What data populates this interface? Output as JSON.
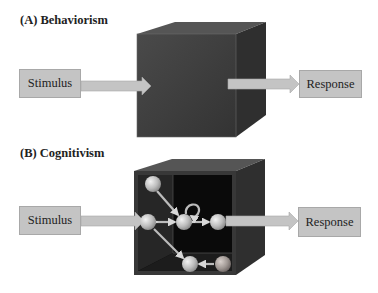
{
  "panels": [
    {
      "title": "(A)  Behaviorism",
      "input_label": "Stimulus",
      "output_label": "Response",
      "box_style": "opaque black box"
    },
    {
      "title": "(B)  Cognitivism",
      "input_label": "Stimulus",
      "output_label": "Response",
      "box_style": "transparent box with internal network of nodes",
      "internal_nodes": 6,
      "internal_links": [
        {
          "from": 1,
          "to": 3,
          "directed": true
        },
        {
          "from": 2,
          "to": 3,
          "directed": "bidirectional"
        },
        {
          "from": 3,
          "to": 3,
          "directed": true,
          "type": "self-loop"
        },
        {
          "from": 3,
          "to": 4,
          "directed": "bidirectional"
        },
        {
          "from": 2,
          "to": 5,
          "directed": true
        },
        {
          "from": 6,
          "to": 5,
          "directed": true
        }
      ]
    }
  ],
  "colors": {
    "box_fill": "#c4c4c4",
    "arrow_fill": "#c0c0c0",
    "cube_front": "#3a3a3a",
    "cube_top": "#4a4a4a",
    "cube_side": "#2e2e2e",
    "cube_interior": "#050505",
    "node_fill": "#cfcfcf"
  }
}
